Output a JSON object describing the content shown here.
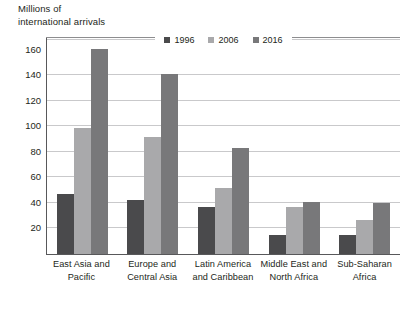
{
  "chart_data": {
    "type": "bar",
    "title": "Millions of\ninternational arrivals",
    "ylabel": "Millions of international arrivals",
    "xlabel": "",
    "ylim": [
      0,
      170
    ],
    "yticks": [
      20,
      40,
      60,
      80,
      100,
      120,
      140,
      160
    ],
    "grid": true,
    "legend_position": "top-inside",
    "categories": [
      "East Asia and\nPacific",
      "Europe and\nCentral Asia",
      "Latin America\nand Caribbean",
      "Middle East and\nNorth Africa",
      "Sub-Saharan\nAfrica"
    ],
    "series": [
      {
        "name": "1996",
        "color": "#4a4a4c",
        "values": [
          47,
          42,
          37,
          15,
          15
        ]
      },
      {
        "name": "2006",
        "color": "#a9a9ab",
        "values": [
          99,
          92,
          52,
          37,
          27
        ]
      },
      {
        "name": "2016",
        "color": "#78787a",
        "values": [
          161,
          141,
          83,
          41,
          40
        ]
      }
    ]
  },
  "axis": {
    "title_line1": "Millions of",
    "title_line2": "international arrivals"
  },
  "legend": {
    "items": [
      {
        "label": "1996"
      },
      {
        "label": "2006"
      },
      {
        "label": "2016"
      }
    ]
  }
}
